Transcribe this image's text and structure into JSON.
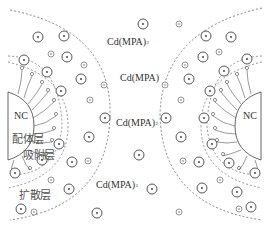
{
  "diagram": {
    "title": "",
    "labels": {
      "cd_top": {
        "base": "Cd(MPA)",
        "sup": "",
        "sub": "2"
      },
      "cd_mid1": {
        "base": "Cd(MPA)",
        "sup": "",
        "sub": ""
      },
      "cd_mid2": {
        "base": "Cd(MPA)",
        "sup": "",
        "sub": "2"
      },
      "cd_bottom": {
        "base": "Cd(MPA)",
        "sup": "",
        "sub": "2"
      },
      "nc_left": "NC",
      "nc_right": "NC",
      "ligand_layer": "配体层",
      "adsorption_layer": "吸附层",
      "diffusion_layer": "扩散层"
    },
    "legend_symbols": {
      "positive_ion": "circled-dot (cation)",
      "negative_ion": "small circled-minus (anion)"
    },
    "colors": {
      "line": "#555555",
      "text": "#333333",
      "layer_text": "#555555"
    }
  }
}
